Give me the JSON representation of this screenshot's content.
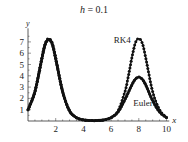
{
  "chart_data": {
    "type": "line",
    "title": "h = 0.1",
    "title_var": "h",
    "title_value": "= 0.1",
    "xlabel": "x",
    "ylabel": "y",
    "xlim": [
      0,
      10.2
    ],
    "ylim": [
      0,
      8.2
    ],
    "xticks": [
      2,
      4,
      6,
      8,
      10
    ],
    "yticks": [
      1,
      2,
      3,
      4,
      5,
      6,
      7
    ],
    "grid": false,
    "legend": "inline annotations",
    "annotations": [
      {
        "text": "RK4",
        "x": 6.2,
        "y": 6.9
      },
      {
        "text": "Euler",
        "x": 7.6,
        "y": 1.3
      }
    ],
    "series": [
      {
        "name": "RK4",
        "marker": "dot",
        "x": [
          0,
          0.5,
          1,
          1.25,
          1.5,
          1.75,
          2,
          2.5,
          3,
          3.5,
          4,
          4.5,
          5,
          5.5,
          6,
          6.5,
          7,
          7.25,
          7.5,
          7.75,
          8,
          8.25,
          8.5,
          9,
          9.5,
          10
        ],
        "y": [
          1.0,
          2.6,
          5.6,
          6.9,
          7.3,
          6.9,
          5.6,
          2.6,
          0.9,
          0.3,
          0.1,
          0.05,
          0.05,
          0.1,
          0.3,
          0.9,
          2.6,
          4.0,
          5.6,
          6.9,
          7.3,
          6.9,
          5.6,
          2.6,
          1.0,
          0.3
        ]
      },
      {
        "name": "Euler",
        "marker": "none",
        "x": [
          0,
          0.5,
          1,
          1.25,
          1.5,
          1.75,
          2,
          2.5,
          3,
          3.5,
          4,
          4.5,
          5,
          5.5,
          6,
          6.5,
          7,
          7.5,
          7.75,
          8,
          8.25,
          8.5,
          9,
          9.5,
          10
        ],
        "y": [
          1.0,
          2.6,
          5.5,
          6.8,
          7.2,
          6.8,
          5.5,
          2.6,
          0.9,
          0.3,
          0.1,
          0.04,
          0.04,
          0.1,
          0.3,
          0.8,
          1.9,
          3.2,
          3.7,
          3.9,
          3.7,
          3.2,
          1.8,
          0.8,
          0.3
        ]
      }
    ]
  }
}
